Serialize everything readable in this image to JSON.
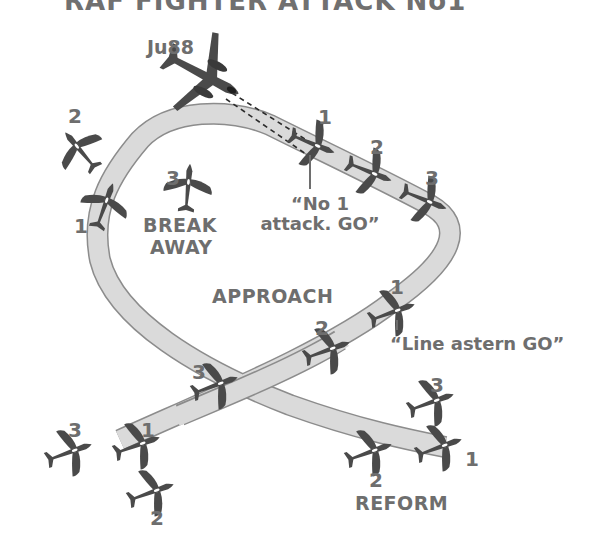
{
  "title": "RAF FIGHTER ATTACK No1",
  "colors": {
    "text": "#6e6e6e",
    "aircraft": "#4a4a4a",
    "path_fill": "#dadada",
    "path_edge": "#8c8c8c",
    "background": "#ffffff"
  },
  "enemy": {
    "label": "Ju88",
    "icon": "bomber-icon"
  },
  "phases": {
    "approach": "APPROACH",
    "break_away": [
      "BREAK",
      "AWAY"
    ],
    "reform": "REFORM"
  },
  "radio_calls": {
    "line_astern": "“Line astern GO”",
    "no1_attack": [
      "“No 1",
      "attack. GO”"
    ]
  },
  "fighters": {
    "attack_run": [
      {
        "number": "1"
      },
      {
        "number": "2"
      },
      {
        "number": "3"
      }
    ],
    "approach": [
      {
        "number": "1"
      },
      {
        "number": "2"
      },
      {
        "number": "3"
      }
    ],
    "start_formation": [
      {
        "number": "1"
      },
      {
        "number": "2"
      },
      {
        "number": "3"
      }
    ],
    "break_away": [
      {
        "number": "1"
      },
      {
        "number": "2"
      },
      {
        "number": "3"
      }
    ],
    "reform": [
      {
        "number": "1"
      },
      {
        "number": "2"
      },
      {
        "number": "3"
      }
    ]
  }
}
